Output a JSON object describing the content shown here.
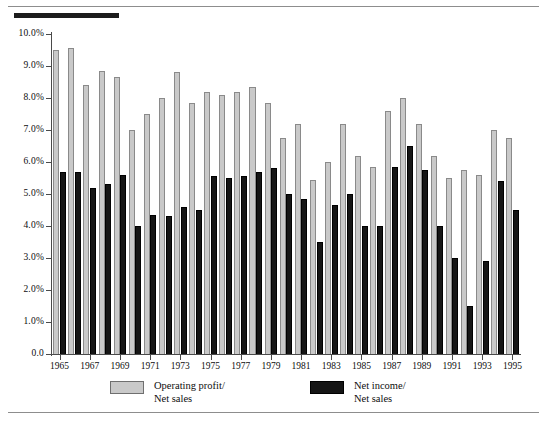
{
  "chart_data": {
    "type": "bar",
    "title": "",
    "subtitle": "",
    "xlabel": "",
    "ylabel": "",
    "grid": false,
    "legend_position": "bottom",
    "ylim": [
      0.0,
      10.0
    ],
    "ytick_labels": [
      "10.0%",
      "9.0%",
      "8.0%",
      "7.0%",
      "6.0%",
      "5.0%",
      "4.0%",
      "3.0%",
      "2.0%",
      "1.0%",
      "0.0"
    ],
    "ytick_values": [
      10.0,
      9.0,
      8.0,
      7.0,
      6.0,
      5.0,
      4.0,
      3.0,
      2.0,
      1.0,
      0.0
    ],
    "categories": [
      "1965",
      "1966",
      "1967",
      "1968",
      "1969",
      "1970",
      "1971",
      "1972",
      "1973",
      "1974",
      "1975",
      "1976",
      "1977",
      "1978",
      "1979",
      "1980",
      "1981",
      "1982",
      "1983",
      "1984",
      "1985",
      "1986",
      "1987",
      "1988",
      "1989",
      "1990",
      "1991",
      "1992",
      "1993",
      "1994",
      "1995"
    ],
    "xtick_labels": [
      "1965",
      "1967",
      "1969",
      "1971",
      "1973",
      "1975",
      "1977",
      "1979",
      "1981",
      "1983",
      "1985",
      "1987",
      "1989",
      "1991",
      "1993",
      "1995"
    ],
    "series": [
      {
        "name": "Operating profit/\nNet sales",
        "label_line1": "Operating profit/",
        "label_line2": "Net sales",
        "color": "#c9c9c9",
        "border_color": "#8a8a8a",
        "values": [
          9.5,
          9.55,
          8.4,
          8.85,
          8.65,
          7.0,
          7.5,
          8.0,
          8.8,
          7.85,
          8.2,
          8.1,
          8.2,
          8.35,
          7.85,
          6.75,
          7.2,
          5.45,
          6.0,
          7.2,
          6.2,
          5.85,
          7.6,
          8.0,
          7.2,
          6.2,
          5.5,
          5.75,
          5.6,
          7.0,
          6.75
        ]
      },
      {
        "name": "Net income/\nNet sales",
        "label_line1": "Net income/",
        "label_line2": "Net sales",
        "color": "#151515",
        "border_color": "#000000",
        "values": [
          5.7,
          5.7,
          5.2,
          5.3,
          5.6,
          4.0,
          4.35,
          4.3,
          4.6,
          4.5,
          5.55,
          5.5,
          5.55,
          5.7,
          5.8,
          5.0,
          4.85,
          3.5,
          4.65,
          5.0,
          4.0,
          4.0,
          5.85,
          6.5,
          5.75,
          4.0,
          3.0,
          1.5,
          2.9,
          5.4,
          4.5
        ]
      }
    ]
  },
  "legend": {
    "items": [
      {
        "label_line1": "Operating profit/",
        "label_line2": "Net sales",
        "swatch": "op"
      },
      {
        "label_line1": "Net income/",
        "label_line2": "Net sales",
        "swatch": "ni"
      }
    ]
  }
}
